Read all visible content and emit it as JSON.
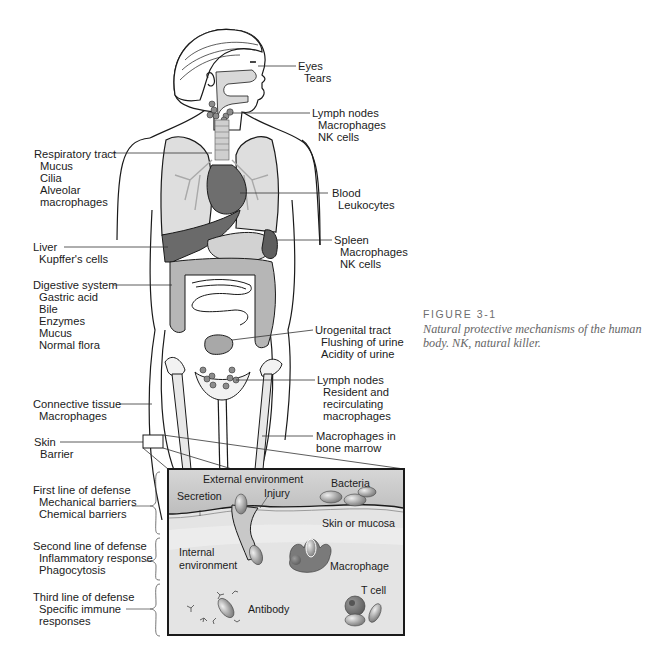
{
  "figure": {
    "number": "FIGURE 3-1",
    "caption": "Natural protective mechanisms of the human body. NK, natural killer."
  },
  "left_labels": [
    {
      "id": "respiratory",
      "head": "Respiratory tract",
      "items": [
        "Mucus",
        "Cilia",
        "Alveolar",
        "macrophages"
      ]
    },
    {
      "id": "liver",
      "head": "Liver",
      "items": [
        "Kupffer's cells"
      ]
    },
    {
      "id": "digestive",
      "head": "Digestive system",
      "items": [
        "Gastric acid",
        "Bile",
        "Enzymes",
        "Mucus",
        "Normal flora"
      ]
    },
    {
      "id": "connective",
      "head": "Connective tissue",
      "items": [
        "Macrophages"
      ]
    },
    {
      "id": "skin",
      "head": "Skin",
      "items": [
        "Barrier"
      ]
    }
  ],
  "right_labels": [
    {
      "id": "eyes",
      "head": "Eyes",
      "items": [
        "Tears"
      ]
    },
    {
      "id": "lymph-upper",
      "head": "Lymph nodes",
      "items": [
        "Macrophages",
        "NK cells"
      ]
    },
    {
      "id": "blood",
      "head": "Blood",
      "items": [
        "Leukocytes"
      ]
    },
    {
      "id": "spleen",
      "head": "Spleen",
      "items": [
        "Macrophages",
        "NK cells"
      ]
    },
    {
      "id": "urogenital",
      "head": "Urogenital tract",
      "items": [
        "Flushing of urine",
        "Acidity of urine"
      ]
    },
    {
      "id": "lymph-lower",
      "head": "Lymph nodes",
      "items": [
        "Resident and",
        "recirculating",
        "macrophages"
      ]
    },
    {
      "id": "bone-marrow",
      "head": "Macrophages in",
      "items": [
        "bone marrow"
      ]
    }
  ],
  "defense_lines": [
    {
      "head": "First line of defense",
      "items": [
        "Mechanical barriers",
        "Chemical barriers"
      ]
    },
    {
      "head": "Second line of defense",
      "items": [
        "Inflammatory response",
        "Phagocytosis"
      ]
    },
    {
      "head": "Third line of defense",
      "items": [
        "Specific immune",
        "responses"
      ]
    }
  ],
  "inset": {
    "external_environment": "External environment",
    "secretion": "Secretion",
    "injury": "Injury",
    "bacteria": "Bacteria",
    "skin_or_mucosa": "Skin or mucosa",
    "internal_environment_1": "Internal",
    "internal_environment_2": "environment",
    "macrophage": "Macrophage",
    "t_cell": "T cell",
    "antibody": "Antibody"
  },
  "colors": {
    "organ_light": "#d8d8d8",
    "organ_mid": "#b4b4b4",
    "organ_dark": "#6e6e6e",
    "outline": "#1a1a1a",
    "inset_external": "#c9c9c9",
    "inset_internal": "#e6e6e6",
    "caption_gray": "#666666"
  }
}
